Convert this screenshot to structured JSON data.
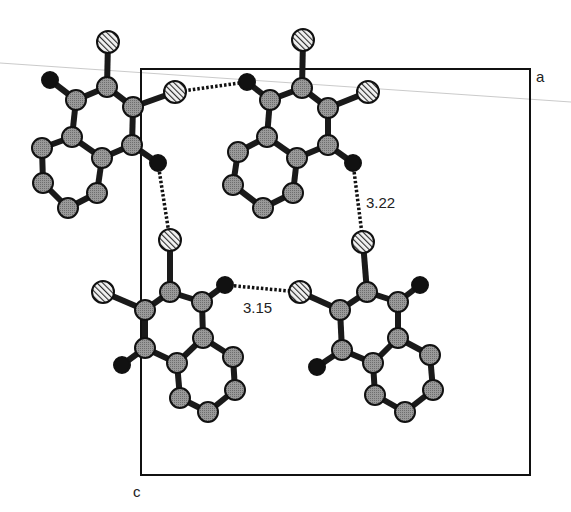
{
  "figure": {
    "type": "crystal-packing-diagram",
    "axis_labels": {
      "a": "a",
      "c": "c"
    },
    "contacts": [
      {
        "label": "3.22",
        "kind": "H...Cl",
        "from": "mol-top-right.H5",
        "to": "mol-bottom-right.Cl_top"
      },
      {
        "label": "3.15",
        "kind": "H...Cl",
        "from": "mol-bottom-left.H3",
        "to": "mol-bottom-right.Cl_left"
      },
      {
        "label": "",
        "kind": "H...Cl",
        "from": "mol-top-left.H5",
        "to": "mol-bottom-left.Cl_top"
      },
      {
        "label": "",
        "kind": "Cl...H",
        "from": "mol-top-left.Cl_right",
        "to": "mol-top-right.H_left"
      }
    ],
    "legend": {
      "atom_types": [
        {
          "type": "C",
          "style": "grey-dotted"
        },
        {
          "type": "Cl",
          "style": "hatched"
        },
        {
          "type": "H",
          "style": "black"
        }
      ]
    },
    "colors": {
      "carbon": "#8a8a8a",
      "hydrogen": "#111111",
      "chlorine": "#d8d8d8",
      "bond": "#1a1a1a",
      "cell": "#111111"
    },
    "molecules": [
      {
        "id": "mol-top-left",
        "name": "dichloronaphthalene"
      },
      {
        "id": "mol-top-right",
        "name": "dichloronaphthalene"
      },
      {
        "id": "mol-bottom-left",
        "name": "dichloronaphthalene"
      },
      {
        "id": "mol-bottom-right",
        "name": "dichloronaphthalene"
      }
    ]
  }
}
